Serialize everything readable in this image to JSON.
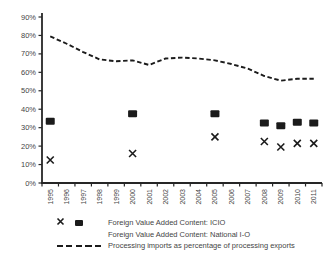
{
  "colors": {
    "background": "#ffffff",
    "axis": "#262626",
    "tick_text": "#454545",
    "marker": "#1b1b1b",
    "line": "#1b1b1b"
  },
  "chart_data": {
    "type": "line",
    "title": "",
    "xlabel": "",
    "ylabel": "",
    "grid": false,
    "legend_position": "bottom-left",
    "ylim": [
      0,
      90
    ],
    "ytick_step": 10,
    "ytick_format": "percent",
    "x": [
      1995,
      1996,
      1997,
      1998,
      1999,
      2000,
      2001,
      2002,
      2003,
      2004,
      2005,
      2006,
      2007,
      2008,
      2009,
      2010,
      2011
    ],
    "series": [
      {
        "name": "Foreign Value Added Content: ICIO",
        "marker": "square",
        "line": "none",
        "values": [
          33.5,
          null,
          null,
          null,
          null,
          37.5,
          null,
          null,
          null,
          null,
          37.5,
          null,
          null,
          32.5,
          31,
          33,
          32.5
        ]
      },
      {
        "name": "Foreign Value Added Content: National I-O",
        "marker": "x",
        "line": "none",
        "values": [
          12.5,
          null,
          null,
          null,
          null,
          16,
          null,
          null,
          null,
          null,
          25,
          null,
          null,
          22.5,
          19.5,
          21.5,
          21.5
        ]
      },
      {
        "name": "Processing imports as percentage of processing exports",
        "marker": "none",
        "line": "dashed",
        "values": [
          79.5,
          75.5,
          71,
          67,
          66,
          66.5,
          64,
          67.5,
          68,
          67.5,
          66.5,
          64.5,
          62,
          58,
          55.5,
          56.5,
          56.5
        ]
      }
    ]
  }
}
